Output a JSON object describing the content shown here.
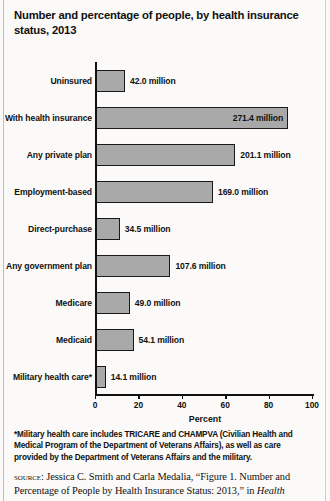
{
  "title": "Number and percentage of people, by health insurance status, 2013",
  "chart_data": {
    "type": "bar",
    "orientation": "horizontal",
    "title": "Number and percentage of people, by health insurance status, 2013",
    "xlabel": "Percent",
    "ylabel": "",
    "xlim": [
      0,
      100
    ],
    "xticks": [
      "0",
      "20",
      "40",
      "60",
      "80",
      "100"
    ],
    "grid": false,
    "legend": null,
    "bar_color": "#a9a9a9",
    "bar_border_color": "#1a1a1a",
    "categories": [
      "Uninsured",
      "With health insurance",
      "Any private plan",
      "Employment-based",
      "Direct-purchase",
      "Any government plan",
      "Medicare",
      "Medicaid",
      "Military health care*"
    ],
    "values": [
      13.4,
      88.5,
      64.2,
      53.9,
      11.0,
      34.3,
      15.6,
      17.3,
      4.5
    ],
    "data_labels": [
      "42.0 million",
      "271.4 million",
      "201.1 million",
      "169.0 million",
      "34.5 million",
      "107.6 million",
      "49.0 million",
      "54.1 million",
      "14.1 million"
    ],
    "label_placement": [
      "outside",
      "inside",
      "outside",
      "outside",
      "outside",
      "outside",
      "outside",
      "outside",
      "outside"
    ]
  },
  "footnote": "*Military health care includes TRICARE and CHAMPVA (Civilian Health and Medical Program of the Department of Veterans Affairs), as well as care provided by the Department of Veterans Affairs and the military.",
  "source": {
    "keyword": "source:",
    "text_before_italic": " Jessica C. Smith and Carla Medalia, “Figure 1. Number and Percentage of People by Health Insurance Status: 2013,” in ",
    "italic_text": "Health"
  }
}
